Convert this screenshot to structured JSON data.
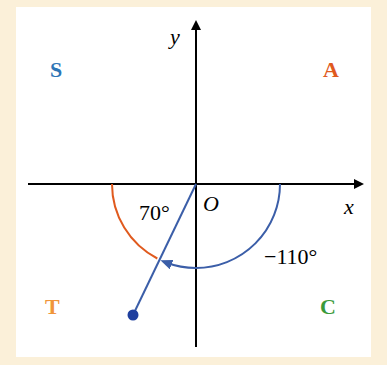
{
  "diagram": {
    "quadrants": {
      "S": {
        "label": "S",
        "color": "#2e75b6"
      },
      "A": {
        "label": "A",
        "color": "#e05a1e"
      },
      "T": {
        "label": "T",
        "color": "#f0953a"
      },
      "C": {
        "label": "C",
        "color": "#3a9a3a"
      }
    },
    "axes": {
      "x_label": "x",
      "y_label": "y",
      "origin_label": "O"
    },
    "angles": {
      "reference": {
        "label": "70°",
        "color": "#e05a1e"
      },
      "rotation": {
        "label": "−110°",
        "color": "#3b5ea8"
      }
    },
    "colors": {
      "background": "#fbf0d9",
      "panel": "#ffffff",
      "axis": "#000000",
      "terminal_side": "#3b5ea8",
      "point": "#1f3f9e"
    }
  }
}
